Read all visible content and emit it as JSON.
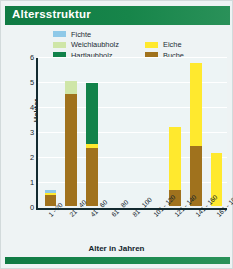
{
  "header": {
    "title": "Altersstruktur"
  },
  "legend": {
    "column1": [
      {
        "label": "Fichte",
        "color": "#8fc9e8"
      },
      {
        "label": "Weichlaubholz",
        "color": "#cfe6a8"
      },
      {
        "label": "Hartlaubholz",
        "color": "#12824a"
      }
    ],
    "column2": [
      {
        "label": "Eiche",
        "color": "#ffe92e"
      },
      {
        "label": "Buche",
        "color": "#a0721d"
      }
    ]
  },
  "chart_data": {
    "type": "bar",
    "title": "Altersstruktur",
    "xlabel": "Alter in Jahren",
    "ylabel": "Hektar",
    "ylim": [
      0,
      6
    ],
    "yticks": [
      0,
      1,
      2,
      3,
      4,
      5,
      6
    ],
    "grid": true,
    "stacked": true,
    "legend_position": "top",
    "categories": [
      "1 - 20",
      "21 - 40",
      "41 - 60",
      "61 - 80",
      "81 - 100",
      "101 - 120",
      "121 - 140",
      "141 - 160",
      "161 - 180"
    ],
    "series": [
      {
        "name": "Buche",
        "color": "#a0721d",
        "values": [
          0.45,
          4.55,
          2.35,
          0,
          0,
          0,
          0.65,
          2.45,
          0
        ]
      },
      {
        "name": "Eiche",
        "color": "#ffe92e",
        "values": [
          0.08,
          0,
          0.18,
          0,
          0,
          0,
          2.55,
          3.35,
          2.15
        ]
      },
      {
        "name": "Hartlaubholz",
        "color": "#12824a",
        "values": [
          0,
          0,
          2.45,
          0,
          0,
          0,
          0,
          0,
          0
        ]
      },
      {
        "name": "Weichlaubholz",
        "color": "#cfe6a8",
        "values": [
          0,
          0.5,
          0,
          0,
          0,
          0,
          0,
          0,
          0
        ]
      },
      {
        "name": "Fichte",
        "color": "#8fc9e8",
        "values": [
          0.1,
          0,
          0,
          0,
          0,
          0,
          0,
          0,
          0
        ]
      }
    ],
    "totals": [
      0.63,
      5.05,
      4.98,
      0,
      0,
      0,
      3.2,
      5.8,
      2.15
    ]
  },
  "colors": {
    "header_green": "#17854a",
    "plot_background": "#edf4f5",
    "axis": "#132a30",
    "card_background": "#eef3f4"
  }
}
